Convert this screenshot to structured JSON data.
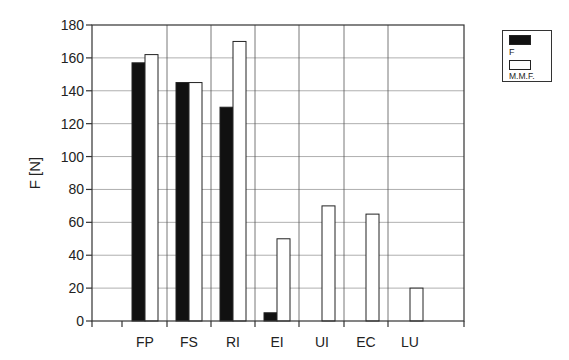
{
  "chart_data": {
    "type": "bar",
    "title": "",
    "xlabel": "",
    "ylabel": "F [N]",
    "ylim": [
      0,
      180
    ],
    "yticks": [
      0,
      20,
      40,
      60,
      80,
      100,
      120,
      140,
      160,
      180
    ],
    "grid": true,
    "legend_position": "top-right outside",
    "categories": [
      "FP",
      "FS",
      "RI",
      "EI",
      "UI",
      "EC",
      "LU"
    ],
    "series": [
      {
        "name": "F",
        "color": "#111111",
        "values": [
          157,
          145,
          130,
          5,
          0,
          0,
          0
        ]
      },
      {
        "name": "M.M.F.",
        "color": "#ffffff",
        "values": [
          162,
          145,
          170,
          50,
          70,
          65,
          20
        ]
      }
    ]
  },
  "legend": {
    "items": [
      {
        "label": "F"
      },
      {
        "label": "M.M.F."
      }
    ]
  }
}
